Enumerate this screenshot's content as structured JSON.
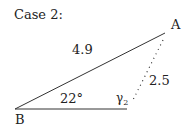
{
  "title": "Case 2:",
  "vertices": {
    "A": "A",
    "B": "B"
  },
  "side_labels": {
    "BA": "4.9",
    "A_dotted": "2.5"
  },
  "angle_labels": {
    "B": "22°",
    "gamma_main": "γ",
    "gamma_sub": "2"
  }
}
